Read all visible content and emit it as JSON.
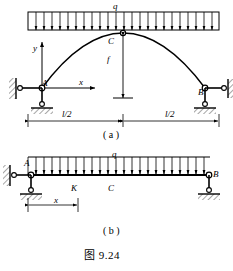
{
  "figure": {
    "caption": "图 9.24",
    "panels": [
      {
        "id": "a",
        "sublabel": "( a )",
        "kind": "three-hinged-parabolic-arch",
        "labels": {
          "load": "q",
          "crown": "C",
          "rise": "f",
          "left_support": "A",
          "right_support": "B",
          "axis_y": "y",
          "axis_x": "x",
          "half_span_left": "l/2",
          "half_span_right": "l/2"
        }
      },
      {
        "id": "b",
        "sublabel": "( b )",
        "kind": "simply-supported-beam",
        "labels": {
          "load": "q",
          "left_support": "A",
          "section": "K",
          "midpoint": "C",
          "right_support": "B",
          "distance": "x"
        }
      }
    ]
  },
  "geometry": {
    "arch": {
      "springing_left_x": 42,
      "springing_right_x": 205,
      "springing_y": 88,
      "crown_x": 123,
      "crown_y": 33,
      "load_bar_top": 12,
      "load_bar_bottom": 30,
      "load_bar_left": 28,
      "load_bar_right": 219,
      "tick_count": 23,
      "dim_line_y": 121,
      "dim_left_x": 28,
      "dim_mid_x": 123,
      "dim_right_x": 219
    },
    "beam": {
      "axis_y": 175,
      "left_x": 28,
      "right_x": 210,
      "load_bar_top": 157,
      "tick_count": 23,
      "node_K_x": 75,
      "node_C_x": 112,
      "dim_line_y": 205,
      "dim_left_x": 28,
      "dim_right_x": 78
    }
  },
  "style": {
    "ink": "#000000",
    "paper": "#ffffff"
  }
}
